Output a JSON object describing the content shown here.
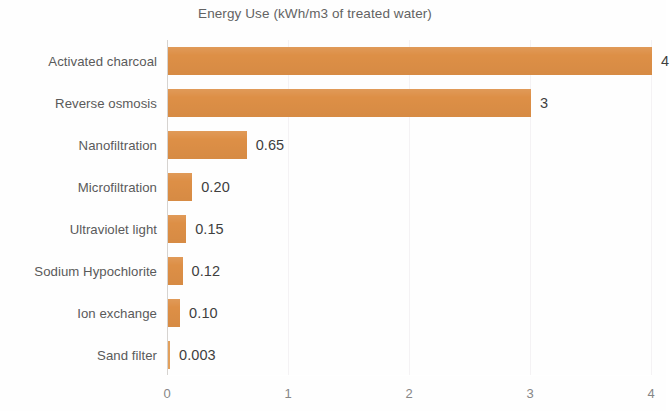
{
  "chart_data": {
    "type": "bar",
    "orientation": "horizontal",
    "title": "Energy Use (kWh/m3 of treated water)",
    "xlabel": "",
    "ylabel": "",
    "xlim": [
      0,
      4
    ],
    "xticks": [
      "0",
      "1",
      "2",
      "3",
      "4"
    ],
    "xtick_values": [
      0,
      1,
      2,
      3,
      4
    ],
    "grid": "vertical-faint",
    "legend": "none",
    "bar_color": "#dd8f46",
    "categories": [
      "Activated charcoal",
      "Reverse osmosis",
      "Nanofiltration",
      "Microfiltration",
      "Ultraviolet light",
      "Sodium Hypochlorite",
      "Ion exchange",
      "Sand filter"
    ],
    "values": [
      4,
      3,
      0.65,
      0.2,
      0.15,
      0.12,
      0.1,
      0.003
    ],
    "data_labels": [
      "4",
      "3",
      "0.65",
      "0.20",
      "0.15",
      "0.12",
      "0.10",
      "0.003"
    ],
    "points": [
      {
        "category": "Activated charcoal",
        "value": 4,
        "label": "4"
      },
      {
        "category": "Reverse osmosis",
        "value": 3,
        "label": "3"
      },
      {
        "category": "Nanofiltration",
        "value": 0.65,
        "label": "0.65"
      },
      {
        "category": "Microfiltration",
        "value": 0.2,
        "label": "0.20"
      },
      {
        "category": "Ultraviolet light",
        "value": 0.15,
        "label": "0.15"
      },
      {
        "category": "Sodium Hypochlorite",
        "value": 0.12,
        "label": "0.12"
      },
      {
        "category": "Ion exchange",
        "value": 0.1,
        "label": "0.10"
      },
      {
        "category": "Sand filter",
        "value": 0.003,
        "label": "0.003"
      }
    ]
  }
}
